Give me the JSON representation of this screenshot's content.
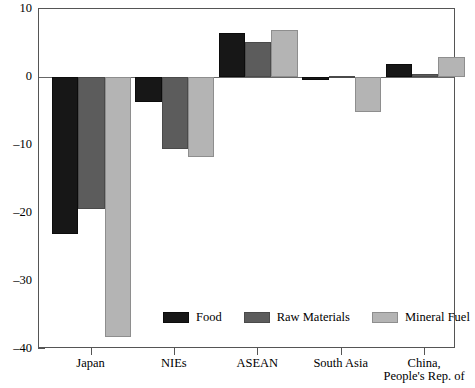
{
  "chart_data": {
    "type": "bar",
    "title": "",
    "subtitle": "",
    "xlabel": "",
    "ylabel": "",
    "ylim": [
      -40,
      10
    ],
    "yticks": [
      10,
      0,
      -10,
      -20,
      -30,
      -40
    ],
    "ytick_labels": [
      "10",
      "0",
      "–10",
      "–20",
      "–30",
      "–40"
    ],
    "grid": false,
    "legend_position": "inside-bottom-center",
    "orientation": "vertical",
    "categories": [
      "Japan",
      "NIEs",
      "ASEAN",
      "South Asia",
      "China, People's Rep. of"
    ],
    "category_labels": [
      {
        "line1": "Japan",
        "line2": ""
      },
      {
        "line1": "NIEs",
        "line2": ""
      },
      {
        "line1": "ASEAN",
        "line2": ""
      },
      {
        "line1": "South Asia",
        "line2": ""
      },
      {
        "line1": "China,",
        "line2": "People's Rep. of"
      }
    ],
    "series": [
      {
        "name": "Food",
        "color": "#171717",
        "values": [
          -23.1,
          -3.7,
          6.4,
          -0.5,
          1.9
        ]
      },
      {
        "name": "Raw Materials",
        "color": "#5c5c5c",
        "values": [
          -19.4,
          -10.6,
          5.2,
          0.1,
          0.4
        ]
      },
      {
        "name": "Mineral Fuel",
        "color": "#b4b4b4",
        "values": [
          -38.2,
          -11.7,
          6.9,
          -5.2,
          3.0
        ]
      }
    ]
  },
  "legend": {
    "entries": [
      {
        "label": "Food"
      },
      {
        "label": "Raw Materials"
      },
      {
        "label": "Mineral Fuel"
      }
    ]
  },
  "colors": {
    "food": "#171717",
    "raw_materials": "#5c5c5c",
    "mineral_fuel": "#b4b4b4",
    "axis": "#555555",
    "zero_line": "#666666",
    "background": "#ffffff",
    "text": "#000000"
  }
}
